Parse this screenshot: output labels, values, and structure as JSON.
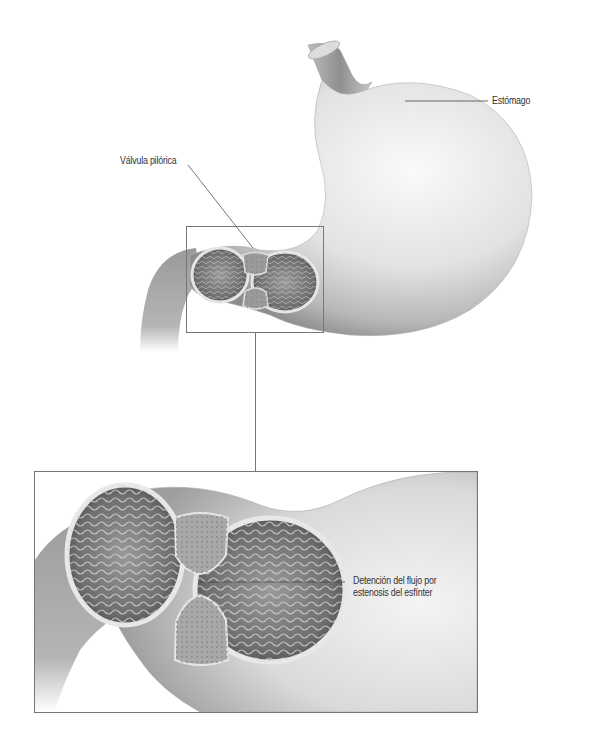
{
  "diagram": {
    "labels": {
      "stomach": "Estómago",
      "pyloric_valve": "Válvula pilórica",
      "detail_line1": "Detención del flujo por",
      "detail_line2": "estenosis del esfínter"
    },
    "regions": {
      "overview": "stomach-overview-illustration",
      "zoom_box": "pyloric-detail-inset",
      "detail": "pyloric-stenosis-detail-illustration"
    },
    "colors": {
      "background": "#ffffff",
      "stomach_light": "#f2f2f2",
      "stomach_mid": "#c8c8c8",
      "stomach_dark": "#8a8a8a",
      "lumen_dark": "#555555",
      "frame": "#777777",
      "label_text": "#333333"
    }
  }
}
